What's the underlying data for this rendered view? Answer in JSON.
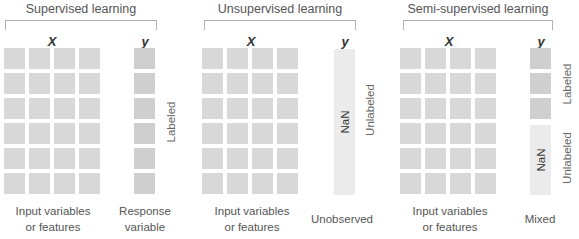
{
  "panels": [
    {
      "title": "Supervised learning",
      "x_label": "X",
      "y_label": "y",
      "x_caption": [
        "Input variables",
        "or features"
      ],
      "y_caption": [
        "Response",
        "variable"
      ],
      "side_labels": [
        "Labeled"
      ]
    },
    {
      "title": "Unsupervised learning",
      "x_label": "X",
      "y_label": "y",
      "x_caption": [
        "Input variables",
        "or features"
      ],
      "y_caption": [
        "Unobserved"
      ],
      "y_value": "NaN",
      "side_labels": [
        "Unlabeled"
      ]
    },
    {
      "title": "Semi-supervised learning",
      "x_label": "X",
      "y_label": "y",
      "x_caption": [
        "Input variables",
        "or features"
      ],
      "y_caption": [
        "Mixed"
      ],
      "y_value": "NaN",
      "side_labels": [
        "Labeled",
        "Unlabeled"
      ]
    }
  ],
  "grid": {
    "rows": 6,
    "feature_columns": 4
  },
  "colors": {
    "cell": "#d8d8d8",
    "label_cell": "#cfcfcf",
    "nan_cell": "#ebebeb"
  }
}
